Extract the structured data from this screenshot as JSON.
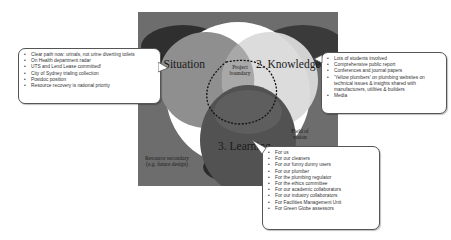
{
  "diagram": {
    "circles": {
      "situation": "1. Situation",
      "knowledge": "2. Knowledge",
      "learning": "3. Learning"
    },
    "labels": {
      "project_boundary": "Project boundary",
      "field_of_vision": "Field of vision",
      "resource_secondary": "Resource secondary (e.g. future design)"
    },
    "colors": {
      "background": "#6d6d6d",
      "situation": "#8a8a8a",
      "knowledge": "#dcdcdc",
      "learning": "#4a4a4a",
      "field_of_vision": "#ffffff"
    }
  },
  "callouts": {
    "situation": {
      "items": [
        "Clear path now: urinals, not urine diverting toilets",
        "On Health department radar",
        "UTS and Lend Lease committed!",
        "City of Sydney trialing collection",
        "Postdoc position",
        "Resource recovery is national priority"
      ]
    },
    "knowledge": {
      "items": [
        "Lots of students involved",
        "Comprehensive public report",
        "Conferences and journal papers",
        "'Yellow plumbers' on plumbing websites on technical issues & insights shared with manufacturers, utilities & builders",
        "Media"
      ]
    },
    "learning": {
      "items": [
        "For us",
        "For our cleaners",
        "For our funny dunny users",
        "For our plumber",
        "For the plumbing regulator",
        "For the ethics committee",
        "For our academic collaborators",
        "For our industry collaborators",
        "For Facilities Management Unit",
        "For Green Globe assessors"
      ]
    }
  }
}
